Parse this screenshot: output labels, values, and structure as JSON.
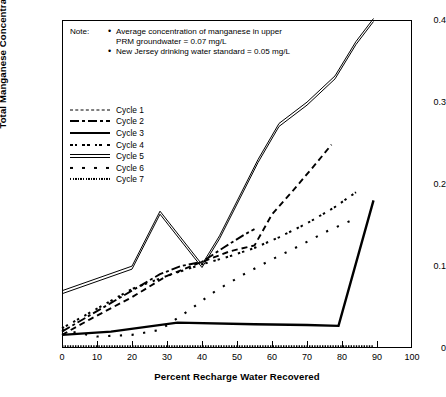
{
  "chart_data": {
    "type": "line",
    "title": "",
    "xlabel": "Percent Recharge Water Recovered",
    "ylabel": "Total Manganese Concentration (mg/l)",
    "xlim": [
      0,
      100
    ],
    "ylim": [
      0,
      0.4
    ],
    "xticks": [
      0,
      10,
      20,
      30,
      40,
      50,
      60,
      70,
      80,
      90,
      100
    ],
    "xtick_labels": [
      "0",
      "10",
      "20",
      "30",
      "40",
      "50",
      "60",
      "70",
      "80",
      "90",
      "100"
    ],
    "yticks": [
      0,
      0.1,
      0.2,
      0.3,
      0.4
    ],
    "ytick_labels": [
      "0",
      "0.1",
      "0.2",
      "0.3",
      "0.4"
    ],
    "grid": false,
    "legend_position": "upper left inside",
    "series": [
      {
        "name": "Cycle 1",
        "style": "dashed",
        "x": [
          0,
          8,
          20,
          30,
          40,
          48,
          55,
          60,
          66,
          72,
          77
        ],
        "y": [
          0.016,
          0.035,
          0.062,
          0.088,
          0.105,
          0.118,
          0.125,
          0.163,
          0.192,
          0.222,
          0.248
        ]
      },
      {
        "name": "Cycle 2",
        "style": "dash-dot",
        "x": [
          0,
          10,
          20,
          28,
          34,
          40,
          46,
          52,
          55
        ],
        "y": [
          0.02,
          0.045,
          0.07,
          0.09,
          0.1,
          0.105,
          0.122,
          0.138,
          0.145
        ]
      },
      {
        "name": "Cycle 3",
        "style": "solid-thick",
        "x": [
          0,
          14,
          33,
          55,
          70,
          79,
          89
        ],
        "y": [
          0.016,
          0.02,
          0.031,
          0.029,
          0.028,
          0.027,
          0.18
        ]
      },
      {
        "name": "Cycle 4",
        "style": "dot-dash-fine",
        "x": [
          0,
          10,
          20,
          30,
          40,
          48,
          55,
          62,
          70,
          78,
          84
        ],
        "y": [
          0.024,
          0.048,
          0.072,
          0.088,
          0.102,
          0.112,
          0.122,
          0.135,
          0.152,
          0.172,
          0.19
        ]
      },
      {
        "name": "Cycle 5",
        "style": "double-line",
        "x": [
          0,
          20,
          28,
          40,
          45,
          56,
          62,
          70,
          78,
          84,
          89
        ],
        "y": [
          0.068,
          0.098,
          0.165,
          0.1,
          0.135,
          0.228,
          0.272,
          0.298,
          0.33,
          0.372,
          0.4
        ]
      },
      {
        "name": "Cycle 6",
        "style": "sparse-dots",
        "x": [
          0,
          10,
          20,
          28,
          36,
          44,
          52,
          60,
          68,
          76,
          84
        ],
        "y": [
          0.022,
          0.014,
          0.016,
          0.022,
          0.045,
          0.07,
          0.09,
          0.108,
          0.125,
          0.143,
          0.158
        ]
      },
      {
        "name": "Cycle 7",
        "style": "fine-dots-baseline",
        "x": [
          0,
          20,
          40,
          60,
          80,
          89
        ],
        "y": [
          0.002,
          0.002,
          0.002,
          0.002,
          0.002,
          0.002
        ]
      }
    ],
    "legend_entries": [
      {
        "label": "Cycle 1",
        "style_class": "s1"
      },
      {
        "label": "Cycle 2",
        "style_class": "s2"
      },
      {
        "label": "Cycle 3",
        "style_class": "s3"
      },
      {
        "label": "Cycle 4",
        "style_class": "s4"
      },
      {
        "label": "Cycle 5",
        "style_class": "s5"
      },
      {
        "label": "Cycle 6",
        "style_class": "s6"
      },
      {
        "label": "Cycle 7",
        "style_class": "s7"
      }
    ],
    "annotations": {
      "note_label": "Note:",
      "note_items": [
        "Average concentration of manganese in upper PRM groundwater = 0.07 mg/L",
        "New Jersey drinking water standard = 0.05 mg/L"
      ],
      "note_item_lines": [
        [
          "Average concentration of manganese in upper",
          "PRM groundwater = 0.07 mg/L"
        ],
        [
          "New Jersey drinking water standard = 0.05 mg/L"
        ]
      ]
    },
    "colors": {
      "line": "#000000",
      "background": "#ffffff",
      "axis": "#000000"
    }
  }
}
